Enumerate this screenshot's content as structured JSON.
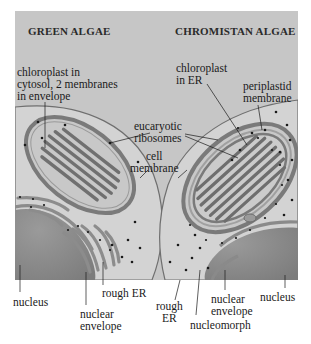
{
  "titles": {
    "left": "GREEN ALGAE",
    "right": "CHROMISTAN ALGAE"
  },
  "labels": {
    "chloroplast_cytosol": "chloroplast in\ncytosol, 2 membranes\nin envelope",
    "chloroplast_er": "chloroplast\nin ER",
    "periplastid": "periplastid\nmembrane",
    "ribosomes": "eucaryotic\nribosomes",
    "cell_membrane": "cell\nmembrane",
    "nucleus_left": "nucleus",
    "rough_er_left": "rough ER",
    "nuclear_envelope_left": "nuclear\nenvelope",
    "rough_er_right": "rough\nER",
    "nuclear_envelope_right": "nuclear\nenvelope",
    "nucleomorph": "nucleomorph",
    "nucleus_right": "nucleus"
  },
  "colors": {
    "background": "#c9c9c9",
    "cytoplasm": "#d4d4d4",
    "nucleus": "#8a8a8a",
    "membrane": "#7a7a7a",
    "thylakoid": "#6e6e6e",
    "ribosome": "#1a1a1a"
  }
}
